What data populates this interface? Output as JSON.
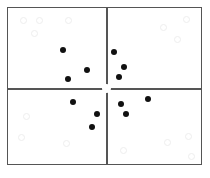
{
  "diagram": {
    "type": "quadrant-scatter",
    "center_marker": "hollow-circle",
    "dots": [
      {
        "x": 63,
        "y": 50
      },
      {
        "x": 87,
        "y": 70
      },
      {
        "x": 68,
        "y": 79
      },
      {
        "x": 114,
        "y": 52
      },
      {
        "x": 124,
        "y": 67
      },
      {
        "x": 119,
        "y": 77
      },
      {
        "x": 73,
        "y": 102
      },
      {
        "x": 97,
        "y": 114
      },
      {
        "x": 92,
        "y": 127
      },
      {
        "x": 148,
        "y": 99
      },
      {
        "x": 121,
        "y": 104
      },
      {
        "x": 126,
        "y": 114
      }
    ],
    "faint_marks": [
      {
        "x": 23,
        "y": 20
      },
      {
        "x": 39,
        "y": 20
      },
      {
        "x": 68,
        "y": 20
      },
      {
        "x": 34,
        "y": 33
      },
      {
        "x": 163,
        "y": 27
      },
      {
        "x": 186,
        "y": 19
      },
      {
        "x": 177,
        "y": 39
      },
      {
        "x": 26,
        "y": 116
      },
      {
        "x": 21,
        "y": 137
      },
      {
        "x": 66,
        "y": 143
      },
      {
        "x": 167,
        "y": 142
      },
      {
        "x": 188,
        "y": 136
      },
      {
        "x": 191,
        "y": 156
      },
      {
        "x": 123,
        "y": 150
      }
    ]
  }
}
